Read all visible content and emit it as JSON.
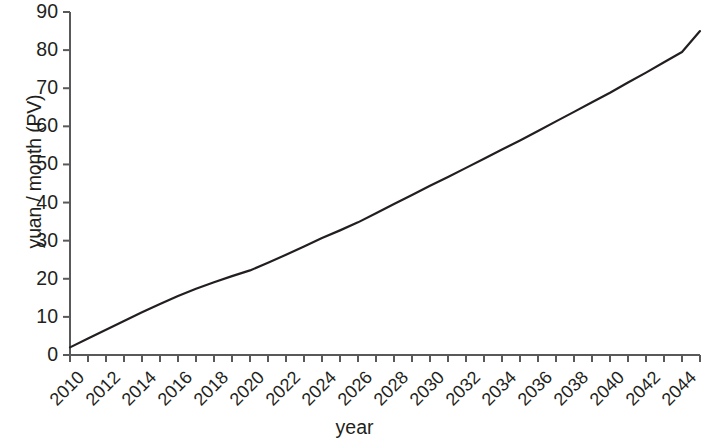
{
  "chart_data": {
    "type": "line",
    "title": "",
    "xlabel": "year",
    "ylabel": "yuan / month (PV)",
    "xlim": [
      2010,
      2045
    ],
    "ylim": [
      0,
      90
    ],
    "grid": false,
    "legend": null,
    "line_color": "#231f20",
    "axis_color": "#58595b",
    "background_color": "#ffffff",
    "y_ticks": [
      0,
      10,
      20,
      30,
      40,
      50,
      60,
      70,
      80,
      90
    ],
    "y_tick_labels": [
      "0",
      "10",
      "20",
      "30",
      "40",
      "50",
      "60",
      "70",
      "80",
      "90"
    ],
    "x_ticks": [
      2010,
      2011,
      2012,
      2013,
      2014,
      2015,
      2016,
      2017,
      2018,
      2019,
      2020,
      2021,
      2022,
      2023,
      2024,
      2025,
      2026,
      2027,
      2028,
      2029,
      2030,
      2031,
      2032,
      2033,
      2034,
      2035,
      2036,
      2037,
      2038,
      2039,
      2040,
      2041,
      2042,
      2043,
      2044,
      2045
    ],
    "x_tick_labels": [
      "2010",
      "2012",
      "2014",
      "2016",
      "2018",
      "2020",
      "2022",
      "2024",
      "2026",
      "2028",
      "2030",
      "2032",
      "2034",
      "2036",
      "2038",
      "2040",
      "2042",
      "2044"
    ],
    "x_tick_label_years": [
      2010,
      2012,
      2014,
      2016,
      2018,
      2020,
      2022,
      2024,
      2026,
      2028,
      2030,
      2032,
      2034,
      2036,
      2038,
      2040,
      2042,
      2044
    ],
    "x_tick_label_rotation": -45,
    "x": [
      2010,
      2011,
      2012,
      2013,
      2014,
      2015,
      2016,
      2017,
      2018,
      2019,
      2020,
      2021,
      2022,
      2023,
      2024,
      2025,
      2026,
      2027,
      2028,
      2029,
      2030,
      2031,
      2032,
      2033,
      2034,
      2035,
      2036,
      2037,
      2038,
      2039,
      2040,
      2041,
      2042,
      2043,
      2044,
      2045
    ],
    "y": [
      2.0,
      4.3,
      6.6,
      8.9,
      11.2,
      13.4,
      15.5,
      17.4,
      19.1,
      20.7,
      22.2,
      24.2,
      26.3,
      28.5,
      30.7,
      32.7,
      34.8,
      37.2,
      39.6,
      42.0,
      44.4,
      46.7,
      49.1,
      51.5,
      53.9,
      56.3,
      58.8,
      61.3,
      63.8,
      66.3,
      68.8,
      71.5,
      74.1,
      76.8,
      79.5,
      85.0
    ],
    "series_name": "present value of yuan per month"
  }
}
